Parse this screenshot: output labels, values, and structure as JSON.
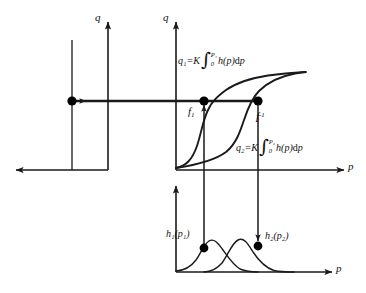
{
  "figure": {
    "type": "diagram"
  },
  "axes": {
    "left_q_label": "q",
    "main_q_label": "q",
    "main_p_label": "p",
    "bottom_p_label": "p"
  },
  "labels": {
    "g_equality": "g₁(q₁)=g₂(q₂)",
    "f1": "f",
    "f1_sub": "1",
    "f2": "f",
    "f2_sub": "2",
    "f2_sup": "-1",
    "h1": "h₁(p₁)",
    "h2": "h₂(p₂)"
  },
  "formulas": {
    "q1": {
      "lhs": "q₁=K",
      "upper": "P₁",
      "lower": "0",
      "integrand": "h(p)",
      "differential_rm": "d",
      "differential_var": "p"
    },
    "q2": {
      "lhs": "q₂=K",
      "upper": "P₂",
      "lower": "0",
      "integrand": "h(p)",
      "differential_rm": "d",
      "differential_var": "p"
    }
  },
  "markers": {
    "left_dot": "g-equality-point",
    "f1_dot": "f1-point",
    "f2_dot": "f2-inverse-point",
    "h1_dot": "h1-point",
    "h2_dot": "h2-point"
  },
  "colors": {
    "stroke": "#1a1a1a",
    "background": "#ffffff",
    "marker": "#000000"
  }
}
